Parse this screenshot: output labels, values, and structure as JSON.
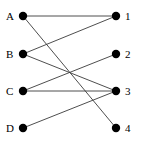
{
  "diagram": {
    "type": "bipartite-graph",
    "background_color": "#ffffff",
    "node_color": "#000000",
    "edge_color": "#3a3a3a",
    "node_radius": 4.2,
    "edge_width": 0.9,
    "left_nodes": [
      {
        "id": "A",
        "label": "A",
        "x": 23,
        "y": 16,
        "label_x": 6,
        "label_y": 11
      },
      {
        "id": "B",
        "label": "B",
        "x": 23,
        "y": 54,
        "label_x": 6,
        "label_y": 49
      },
      {
        "id": "C",
        "label": "C",
        "x": 23,
        "y": 91,
        "label_x": 6,
        "label_y": 86
      },
      {
        "id": "D",
        "label": "D",
        "x": 23,
        "y": 128,
        "label_x": 6,
        "label_y": 123
      }
    ],
    "right_nodes": [
      {
        "id": "1",
        "label": "1",
        "x": 116,
        "y": 16,
        "label_x": 125,
        "label_y": 11
      },
      {
        "id": "2",
        "label": "2",
        "x": 116,
        "y": 54,
        "label_x": 125,
        "label_y": 49
      },
      {
        "id": "3",
        "label": "3",
        "x": 116,
        "y": 91,
        "label_x": 125,
        "label_y": 86
      },
      {
        "id": "4",
        "label": "4",
        "x": 116,
        "y": 128,
        "label_x": 125,
        "label_y": 123
      }
    ],
    "edges": [
      {
        "from": "A",
        "to": "1",
        "x1": 23,
        "y1": 16,
        "x2": 116,
        "y2": 16
      },
      {
        "from": "A",
        "to": "4",
        "x1": 23,
        "y1": 16,
        "x2": 116,
        "y2": 128
      },
      {
        "from": "B",
        "to": "1",
        "x1": 23,
        "y1": 54,
        "x2": 116,
        "y2": 16
      },
      {
        "from": "B",
        "to": "3",
        "x1": 23,
        "y1": 54,
        "x2": 116,
        "y2": 91
      },
      {
        "from": "C",
        "to": "2",
        "x1": 23,
        "y1": 91,
        "x2": 116,
        "y2": 54
      },
      {
        "from": "C",
        "to": "3",
        "x1": 23,
        "y1": 91,
        "x2": 116,
        "y2": 91
      },
      {
        "from": "D",
        "to": "3",
        "x1": 23,
        "y1": 128,
        "x2": 116,
        "y2": 91
      }
    ]
  }
}
